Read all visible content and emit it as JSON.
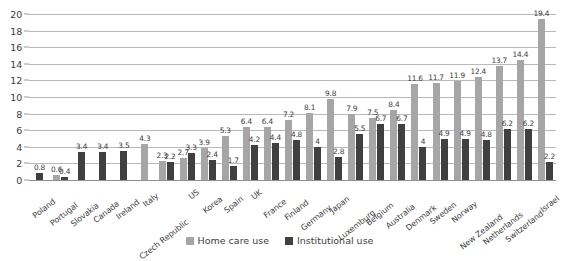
{
  "chart_data": {
    "type": "bar",
    "title": "",
    "subtitle": "",
    "xlabel": "",
    "ylabel": "",
    "ylim": [
      0,
      20
    ],
    "ytick_step": 2,
    "yticks": [
      0,
      2,
      4,
      6,
      8,
      10,
      12,
      14,
      16,
      18,
      20
    ],
    "grid": true,
    "legend_position": "bottom-center",
    "orientation": "vertical",
    "grouping": "grouped",
    "categories": [
      "Poland",
      "Portugal",
      "Slovakia",
      "Canada",
      "Ireland",
      "Italy",
      "Czech Republic",
      "US",
      "Korea",
      "Spain",
      "UK",
      "France",
      "Finland",
      "Germany",
      "Japan",
      "Luxemburg",
      "Belgium",
      "Australia",
      "Denmark",
      "Sweden",
      "Norway",
      "New Zealand",
      "Netherlands",
      "Switzerland",
      "Israel"
    ],
    "series": [
      {
        "name": "Home care use",
        "color": "#a6a6a6",
        "values": [
          null,
          0.6,
          null,
          null,
          null,
          4.3,
          2.3,
          2.7,
          3.9,
          5.3,
          6.4,
          6.4,
          7.2,
          8.1,
          9.8,
          7.9,
          7.5,
          8.4,
          11.6,
          11.7,
          11.9,
          12.4,
          13.7,
          14.4,
          19.4
        ]
      },
      {
        "name": "Institutional use",
        "color": "#404040",
        "values": [
          0.8,
          0.4,
          3.4,
          3.4,
          3.5,
          null,
          2.2,
          3.3,
          2.4,
          1.7,
          4.2,
          4.4,
          4.8,
          4,
          2.8,
          5.5,
          6.7,
          6.7,
          4,
          4.9,
          4.9,
          4.8,
          6.2,
          6.2,
          2.2
        ]
      }
    ]
  },
  "legend": {
    "items": [
      {
        "label": "Home care use",
        "color": "#a6a6a6"
      },
      {
        "label": "Institutional use",
        "color": "#404040"
      }
    ]
  },
  "colors": {
    "home_care": "#a6a6a6",
    "institutional": "#404040",
    "gridline": "#b9b9b9",
    "text": "#3d3d3d",
    "background": "#ffffff"
  }
}
